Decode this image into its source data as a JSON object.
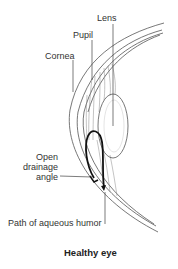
{
  "figure": {
    "title": "Healthy eye",
    "labels": {
      "lens": "Lens",
      "pupil": "Pupil",
      "cornea": "Cornea",
      "drainage_line1": "Open",
      "drainage_line2": "drainage",
      "drainage_line3": "angle",
      "aqueous": "Path of aqueous humor"
    }
  },
  "colors": {
    "line": "#444444",
    "text": "#333333",
    "path": "#111111",
    "background": "#ffffff"
  }
}
